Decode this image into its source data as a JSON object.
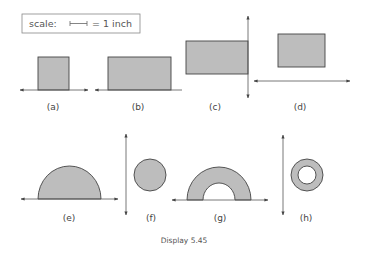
{
  "scale": {
    "label": "scale:",
    "equals": "= 1 inch"
  },
  "figures": [
    {
      "id": "a",
      "label": "(a)",
      "shape": "square",
      "axis": "horizontal"
    },
    {
      "id": "b",
      "label": "(b)",
      "shape": "rectangle",
      "axis": "horizontal"
    },
    {
      "id": "c",
      "label": "(c)",
      "shape": "rectangle",
      "axis": "vertical"
    },
    {
      "id": "d",
      "label": "(d)",
      "shape": "rectangle",
      "axis": "horizontal"
    },
    {
      "id": "e",
      "label": "(e)",
      "shape": "semicircle",
      "axis": "horizontal"
    },
    {
      "id": "f",
      "label": "(f)",
      "shape": "circle",
      "axis": "vertical"
    },
    {
      "id": "g",
      "label": "(g)",
      "shape": "half-annulus",
      "axis": "horizontal"
    },
    {
      "id": "h",
      "label": "(h)",
      "shape": "annulus",
      "axis": "vertical"
    }
  ],
  "caption": "Display 5.45",
  "colors": {
    "fill": "#bdbdbd",
    "stroke": "#444444",
    "axis": "#555555"
  }
}
